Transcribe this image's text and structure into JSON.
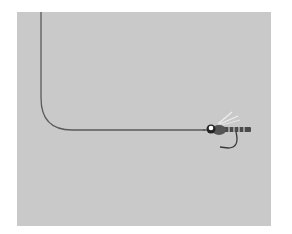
{
  "illustration": {
    "subject": "fishing line with fly lure",
    "colors": {
      "background": "#ffffff",
      "panel": "#c9c9c9",
      "line": "#5a5a5a",
      "fly_body": "#4a4a4a",
      "fly_eye": "#ffffff",
      "wing": "#eeeeee"
    }
  }
}
